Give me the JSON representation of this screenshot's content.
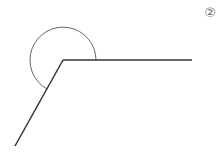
{
  "figure": {
    "label": "②",
    "stroke_color": "#333333",
    "arc_color": "#666666",
    "background": "#ffffff"
  },
  "diagram": {
    "type": "reflex-angle",
    "vertex": [
      63,
      60
    ],
    "ray_horizontal_end": [
      192,
      60
    ],
    "ray_diagonal_end": [
      15,
      146
    ],
    "arc_radius": 33
  }
}
